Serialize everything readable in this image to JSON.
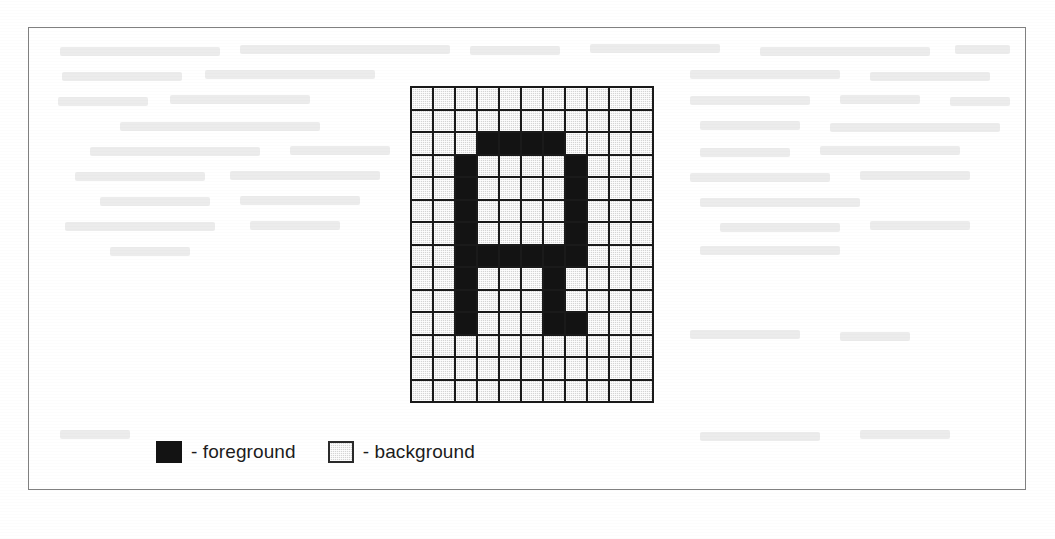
{
  "figure": {
    "frame_border_color": "#808080",
    "background_color": "#ffffff"
  },
  "pixel_grid": {
    "columns": 11,
    "rows": 14,
    "cell_size_px": 22,
    "foreground_color": "#131313",
    "background_color": "#d4d4d4",
    "gridline_color": "#1a1a1a",
    "glyph_description": "letter-A bitmap",
    "matrix": [
      [
        0,
        0,
        0,
        0,
        0,
        0,
        0,
        0,
        0,
        0,
        0
      ],
      [
        0,
        0,
        0,
        0,
        0,
        0,
        0,
        0,
        0,
        0,
        0
      ],
      [
        0,
        0,
        0,
        1,
        1,
        1,
        1,
        0,
        0,
        0,
        0
      ],
      [
        0,
        0,
        1,
        0,
        0,
        0,
        0,
        1,
        0,
        0,
        0
      ],
      [
        0,
        0,
        1,
        0,
        0,
        0,
        0,
        1,
        0,
        0,
        0
      ],
      [
        0,
        0,
        1,
        0,
        0,
        0,
        0,
        1,
        0,
        0,
        0
      ],
      [
        0,
        0,
        1,
        0,
        0,
        0,
        0,
        1,
        0,
        0,
        0
      ],
      [
        0,
        0,
        1,
        1,
        1,
        1,
        1,
        1,
        0,
        0,
        0
      ],
      [
        0,
        0,
        1,
        0,
        0,
        0,
        1,
        0,
        0,
        0,
        0
      ],
      [
        0,
        0,
        1,
        0,
        0,
        0,
        1,
        0,
        0,
        0,
        0
      ],
      [
        0,
        0,
        1,
        0,
        0,
        0,
        1,
        1,
        0,
        0,
        0
      ],
      [
        0,
        0,
        0,
        0,
        0,
        0,
        0,
        0,
        0,
        0,
        0
      ],
      [
        0,
        0,
        0,
        0,
        0,
        0,
        0,
        0,
        0,
        0,
        0
      ],
      [
        0,
        0,
        0,
        0,
        0,
        0,
        0,
        0,
        0,
        0,
        0
      ]
    ]
  },
  "legend": {
    "items": [
      {
        "swatch": "foreground-swatch",
        "label": "- foreground"
      },
      {
        "swatch": "background-swatch",
        "label": "- background"
      }
    ]
  },
  "ghost_lines": [
    {
      "x": 60,
      "y": 47,
      "w": 160
    },
    {
      "x": 240,
      "y": 45,
      "w": 210
    },
    {
      "x": 470,
      "y": 46,
      "w": 90
    },
    {
      "x": 590,
      "y": 44,
      "w": 130
    },
    {
      "x": 760,
      "y": 47,
      "w": 170
    },
    {
      "x": 955,
      "y": 45,
      "w": 55
    },
    {
      "x": 62,
      "y": 72,
      "w": 120
    },
    {
      "x": 205,
      "y": 70,
      "w": 170
    },
    {
      "x": 400,
      "y": 71,
      "w": 0
    },
    {
      "x": 690,
      "y": 70,
      "w": 150
    },
    {
      "x": 870,
      "y": 72,
      "w": 120
    },
    {
      "x": 58,
      "y": 97,
      "w": 90
    },
    {
      "x": 170,
      "y": 95,
      "w": 140
    },
    {
      "x": 690,
      "y": 96,
      "w": 120
    },
    {
      "x": 840,
      "y": 95,
      "w": 80
    },
    {
      "x": 950,
      "y": 97,
      "w": 60
    },
    {
      "x": 120,
      "y": 122,
      "w": 200
    },
    {
      "x": 700,
      "y": 121,
      "w": 100
    },
    {
      "x": 830,
      "y": 123,
      "w": 170
    },
    {
      "x": 90,
      "y": 147,
      "w": 170
    },
    {
      "x": 290,
      "y": 146,
      "w": 100
    },
    {
      "x": 700,
      "y": 148,
      "w": 90
    },
    {
      "x": 820,
      "y": 146,
      "w": 140
    },
    {
      "x": 75,
      "y": 172,
      "w": 130
    },
    {
      "x": 230,
      "y": 171,
      "w": 150
    },
    {
      "x": 690,
      "y": 173,
      "w": 140
    },
    {
      "x": 860,
      "y": 171,
      "w": 110
    },
    {
      "x": 100,
      "y": 197,
      "w": 110
    },
    {
      "x": 240,
      "y": 196,
      "w": 120
    },
    {
      "x": 700,
      "y": 198,
      "w": 160
    },
    {
      "x": 65,
      "y": 222,
      "w": 150
    },
    {
      "x": 250,
      "y": 221,
      "w": 90
    },
    {
      "x": 720,
      "y": 223,
      "w": 120
    },
    {
      "x": 870,
      "y": 221,
      "w": 100
    },
    {
      "x": 110,
      "y": 247,
      "w": 80
    },
    {
      "x": 700,
      "y": 246,
      "w": 140
    },
    {
      "x": 60,
      "y": 430,
      "w": 70
    },
    {
      "x": 700,
      "y": 432,
      "w": 120
    },
    {
      "x": 860,
      "y": 430,
      "w": 90
    },
    {
      "x": 690,
      "y": 330,
      "w": 110
    },
    {
      "x": 840,
      "y": 332,
      "w": 70
    }
  ]
}
